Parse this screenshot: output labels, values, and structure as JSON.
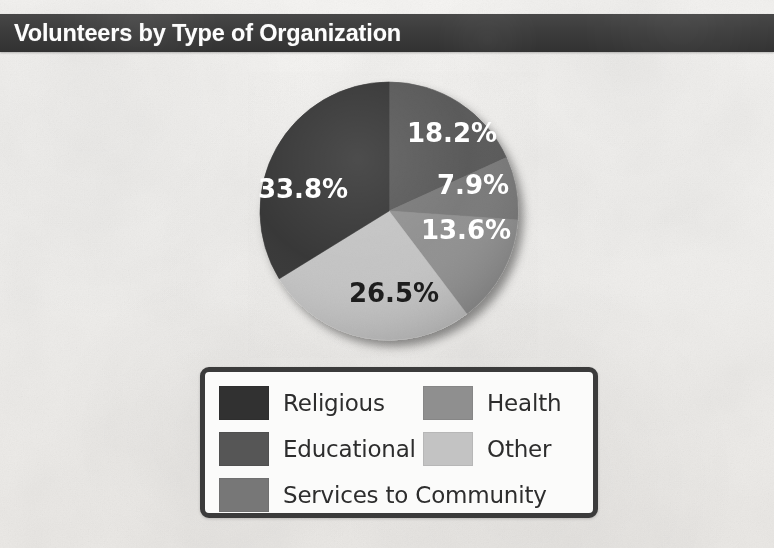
{
  "header": {
    "title": "Volunteers by Type of Organization",
    "band_color": "#3c3c3c",
    "title_color": "#fdfdfd"
  },
  "legend": {
    "items": [
      {
        "label": "Religious",
        "color": "#313131",
        "column": "left",
        "wide": false
      },
      {
        "label": "Health",
        "color": "#8f8f8f",
        "column": "right",
        "wide": false
      },
      {
        "label": "Educational",
        "color": "#565656",
        "column": "left",
        "wide": false
      },
      {
        "label": "Other",
        "color": "#c3c3c3",
        "column": "right",
        "wide": false
      },
      {
        "label": "Services to Community",
        "color": "#777777",
        "column": "left",
        "wide": true
      }
    ]
  },
  "chart_data": {
    "type": "pie",
    "title": "Volunteers by Type of Organization",
    "categories": [
      "Educational",
      "Services to Community",
      "Health",
      "Other",
      "Religious"
    ],
    "values": [
      18.2,
      7.9,
      13.6,
      26.5,
      33.8
    ],
    "value_unit": "%",
    "data_labels": [
      "18.2%",
      "7.9%",
      "13.6%",
      "26.5%",
      "33.8%"
    ],
    "colors": [
      "#565656",
      "#777777",
      "#8f8f8f",
      "#c3c3c3",
      "#313131"
    ],
    "label_text_colors": [
      "#ffffff",
      "#ffffff",
      "#ffffff",
      "#1d1d1d",
      "#ffffff"
    ],
    "start_angle_deg": 0,
    "direction": "clockwise",
    "legend_position": "bottom",
    "grid": false,
    "xlabel": "",
    "ylabel": "",
    "slices": [
      {
        "label": "Educational",
        "value": 18.2,
        "display": "18.2%",
        "color": "#565656",
        "text_color": "#ffffff",
        "label_x": 452,
        "label_y": 134
      },
      {
        "label": "Services to Community",
        "value": 7.9,
        "display": "7.9%",
        "color": "#777777",
        "text_color": "#ffffff",
        "label_x": 473,
        "label_y": 186
      },
      {
        "label": "Health",
        "value": 13.6,
        "display": "13.6%",
        "color": "#8f8f8f",
        "text_color": "#ffffff",
        "label_x": 466,
        "label_y": 231
      },
      {
        "label": "Other",
        "value": 26.5,
        "display": "26.5%",
        "color": "#c3c3c3",
        "text_color": "#1d1d1d",
        "label_x": 394,
        "label_y": 294
      },
      {
        "label": "Religious",
        "value": 33.8,
        "display": "33.8%",
        "color": "#313131",
        "text_color": "#ffffff",
        "label_x": 303,
        "label_y": 190
      }
    ]
  }
}
